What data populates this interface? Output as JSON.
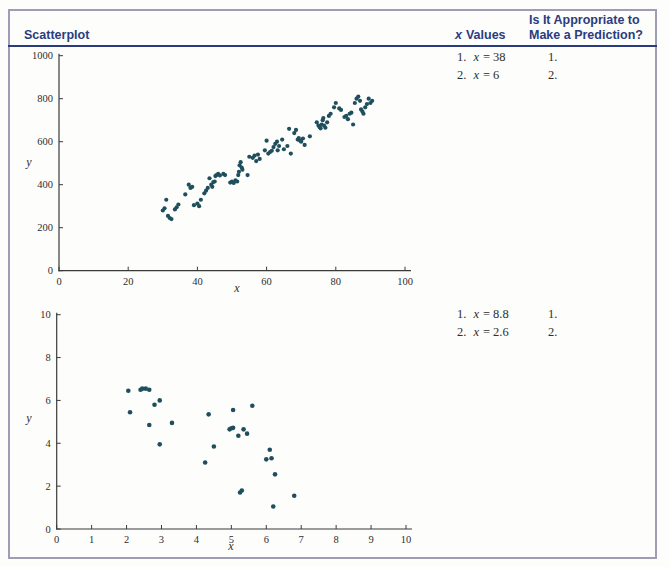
{
  "colors": {
    "accent_navy": "#2b3c7e",
    "box_border": "#9d9db5",
    "point_color": "#1f4f5d",
    "axis_color": "#3a3a3a"
  },
  "table": {
    "header": {
      "scatterplot": "Scatterplot",
      "x_values_var": "x",
      "x_values_rest": "Values",
      "prediction_line1": "Is It Appropriate to",
      "prediction_line2": "Make a Prediction?"
    },
    "rows": [
      {
        "values": [
          {
            "num": "1.",
            "var": "x",
            "rest": "= 38"
          },
          {
            "num": "2.",
            "var": "x",
            "rest": "= 6"
          }
        ],
        "predictions": [
          "1.",
          "2."
        ]
      },
      {
        "values": [
          {
            "num": "1.",
            "var": "x",
            "rest": "= 8.8"
          },
          {
            "num": "2.",
            "var": "x",
            "rest": "= 2.6"
          }
        ],
        "predictions": [
          "1.",
          "2."
        ]
      }
    ]
  },
  "chart_data": [
    {
      "type": "scatter",
      "title": "",
      "xlabel": "x",
      "ylabel": "y",
      "xlim": [
        0,
        100
      ],
      "ylim": [
        0,
        1000
      ],
      "xticks": [
        0,
        20,
        40,
        60,
        80,
        100
      ],
      "yticks": [
        0,
        200,
        400,
        600,
        800,
        1000
      ],
      "grid": false,
      "legend": null,
      "point_color": "#1f4f5d",
      "points": [
        [
          30,
          280
        ],
        [
          30.5,
          290
        ],
        [
          31,
          330
        ],
        [
          31.5,
          255
        ],
        [
          32,
          245
        ],
        [
          32.5,
          240
        ],
        [
          33.5,
          285
        ],
        [
          34,
          295
        ],
        [
          34.5,
          308
        ],
        [
          36.5,
          355
        ],
        [
          37.5,
          400
        ],
        [
          38,
          385
        ],
        [
          38.5,
          390
        ],
        [
          39,
          305
        ],
        [
          40,
          312
        ],
        [
          40.5,
          300
        ],
        [
          41,
          330
        ],
        [
          42,
          360
        ],
        [
          42.5,
          372
        ],
        [
          43,
          385
        ],
        [
          43.5,
          430
        ],
        [
          44,
          400
        ],
        [
          44.3,
          390
        ],
        [
          44.6,
          412
        ],
        [
          45,
          415
        ],
        [
          45.2,
          440
        ],
        [
          45.5,
          445
        ],
        [
          46,
          450
        ],
        [
          46.5,
          443
        ],
        [
          47.5,
          450
        ],
        [
          48,
          445
        ],
        [
          49.5,
          410
        ],
        [
          50,
          415
        ],
        [
          50.5,
          408
        ],
        [
          51,
          420
        ],
        [
          51.5,
          415
        ],
        [
          51.8,
          445
        ],
        [
          52,
          460
        ],
        [
          52.2,
          490
        ],
        [
          52.5,
          505
        ],
        [
          52.8,
          480
        ],
        [
          53,
          470
        ],
        [
          54.5,
          445
        ],
        [
          55,
          530
        ],
        [
          56,
          525
        ],
        [
          56.5,
          535
        ],
        [
          57,
          510
        ],
        [
          57.5,
          540
        ],
        [
          58,
          520
        ],
        [
          59.5,
          560
        ],
        [
          60,
          605
        ],
        [
          60.5,
          545
        ],
        [
          61,
          552
        ],
        [
          61.5,
          558
        ],
        [
          62,
          575
        ],
        [
          62.5,
          590
        ],
        [
          63,
          600
        ],
        [
          63.2,
          560
        ],
        [
          63.6,
          580
        ],
        [
          64.5,
          610
        ],
        [
          65,
          565
        ],
        [
          66,
          580
        ],
        [
          66.5,
          660
        ],
        [
          67,
          545
        ],
        [
          68,
          640
        ],
        [
          68.5,
          655
        ],
        [
          69,
          610
        ],
        [
          69.3,
          617
        ],
        [
          69.7,
          605
        ],
        [
          70,
          600
        ],
        [
          70.5,
          615
        ],
        [
          71,
          585
        ],
        [
          72.5,
          625
        ],
        [
          74.5,
          690
        ],
        [
          75,
          675
        ],
        [
          75.3,
          668
        ],
        [
          75.6,
          662
        ],
        [
          75.9,
          680
        ],
        [
          76.2,
          700
        ],
        [
          76.4,
          710
        ],
        [
          76.6,
          675
        ],
        [
          77,
          665
        ],
        [
          77.5,
          690
        ],
        [
          78,
          720
        ],
        [
          78.5,
          730
        ],
        [
          79.5,
          760
        ],
        [
          80,
          780
        ],
        [
          81,
          755
        ],
        [
          81.5,
          748
        ],
        [
          82.5,
          715
        ],
        [
          83,
          720
        ],
        [
          83.5,
          705
        ],
        [
          84,
          730
        ],
        [
          84.5,
          735
        ],
        [
          85,
          680
        ],
        [
          85.5,
          780
        ],
        [
          86,
          800
        ],
        [
          86.5,
          810
        ],
        [
          87,
          790
        ],
        [
          87.3,
          750
        ],
        [
          87.7,
          740
        ],
        [
          88,
          730
        ],
        [
          88.5,
          760
        ],
        [
          89,
          775
        ],
        [
          89.5,
          800
        ],
        [
          90,
          780
        ],
        [
          90.5,
          790
        ]
      ]
    },
    {
      "type": "scatter",
      "title": "",
      "xlabel": "x",
      "ylabel": "y",
      "xlim": [
        0,
        10
      ],
      "ylim": [
        0,
        10
      ],
      "xticks": [
        0,
        1,
        2,
        3,
        4,
        5,
        6,
        7,
        8,
        9,
        10
      ],
      "yticks": [
        0,
        2,
        4,
        6,
        8,
        10
      ],
      "grid": false,
      "legend": null,
      "point_color": "#1f4f5d",
      "points": [
        [
          2.05,
          6.45
        ],
        [
          2.1,
          5.45
        ],
        [
          2.4,
          6.5
        ],
        [
          2.45,
          6.55
        ],
        [
          2.55,
          6.55
        ],
        [
          2.65,
          6.5
        ],
        [
          2.65,
          4.85
        ],
        [
          2.8,
          5.8
        ],
        [
          2.95,
          6.0
        ],
        [
          2.95,
          3.95
        ],
        [
          3.3,
          4.95
        ],
        [
          4.25,
          3.1
        ],
        [
          4.35,
          5.35
        ],
        [
          4.5,
          3.85
        ],
        [
          4.95,
          4.65
        ],
        [
          5.0,
          4.7
        ],
        [
          5.05,
          4.72
        ],
        [
          5.05,
          5.55
        ],
        [
          5.2,
          4.35
        ],
        [
          5.25,
          1.7
        ],
        [
          5.3,
          1.8
        ],
        [
          5.35,
          4.65
        ],
        [
          5.45,
          4.45
        ],
        [
          5.6,
          5.75
        ],
        [
          6.0,
          3.25
        ],
        [
          6.1,
          3.7
        ],
        [
          6.15,
          3.3
        ],
        [
          6.25,
          2.55
        ],
        [
          6.2,
          1.05
        ],
        [
          6.8,
          1.55
        ]
      ]
    }
  ]
}
